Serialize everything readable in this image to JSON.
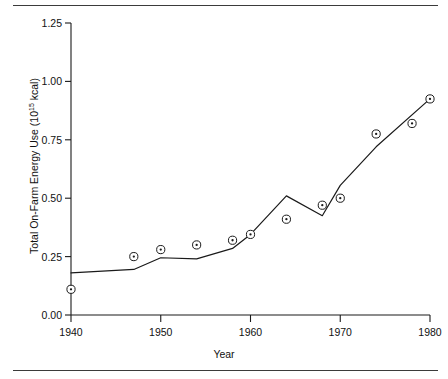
{
  "figure": {
    "has_top_rule": true,
    "has_bottom_rule": true,
    "rule_color": "#3b3b3b",
    "background": "#ffffff"
  },
  "chart_data": {
    "type": "line",
    "title": "",
    "subtitle": "",
    "xlabel": "Year",
    "ylabel_text": "Total On-Farm Energy Use (10",
    "ylabel_exponent": "15",
    "ylabel_suffix": " kcal)",
    "ylabel_full": "Total On-Farm Energy Use (10¹⁵ kcal)",
    "xlim": [
      1940,
      1980
    ],
    "ylim": [
      0.0,
      1.25
    ],
    "grid": false,
    "legend": null,
    "legend_position": "none",
    "line_color": "#1a1a1a",
    "marker_color": "#1a1a1a",
    "marker_style": "circle-with-center-dot",
    "xticks": [
      1940,
      1950,
      1960,
      1970,
      1980
    ],
    "xtick_labels": [
      "1940",
      "1950",
      "1960",
      "1970",
      "1980"
    ],
    "yticks": [
      0.0,
      0.25,
      0.5,
      0.75,
      1.0,
      1.25
    ],
    "ytick_labels": [
      "0.00",
      "0.25",
      "0.50",
      "0.75",
      "1.00",
      "1.25"
    ],
    "series": [
      {
        "name": "markers",
        "kind": "scatter",
        "x": [
          1940,
          1947,
          1950,
          1954,
          1958,
          1960,
          1964,
          1968,
          1970,
          1974,
          1978,
          1980
        ],
        "values": [
          0.11,
          0.25,
          0.28,
          0.3,
          0.32,
          0.345,
          0.41,
          0.47,
          0.5,
          0.775,
          0.82,
          0.925
        ]
      },
      {
        "name": "trend-line",
        "kind": "line",
        "x": [
          1940,
          1947,
          1950,
          1954,
          1958,
          1960,
          1964,
          1968,
          1970,
          1974,
          1980
        ],
        "values": [
          0.18,
          0.195,
          0.245,
          0.24,
          0.285,
          0.345,
          0.51,
          0.425,
          0.555,
          0.72,
          0.925
        ]
      }
    ]
  }
}
